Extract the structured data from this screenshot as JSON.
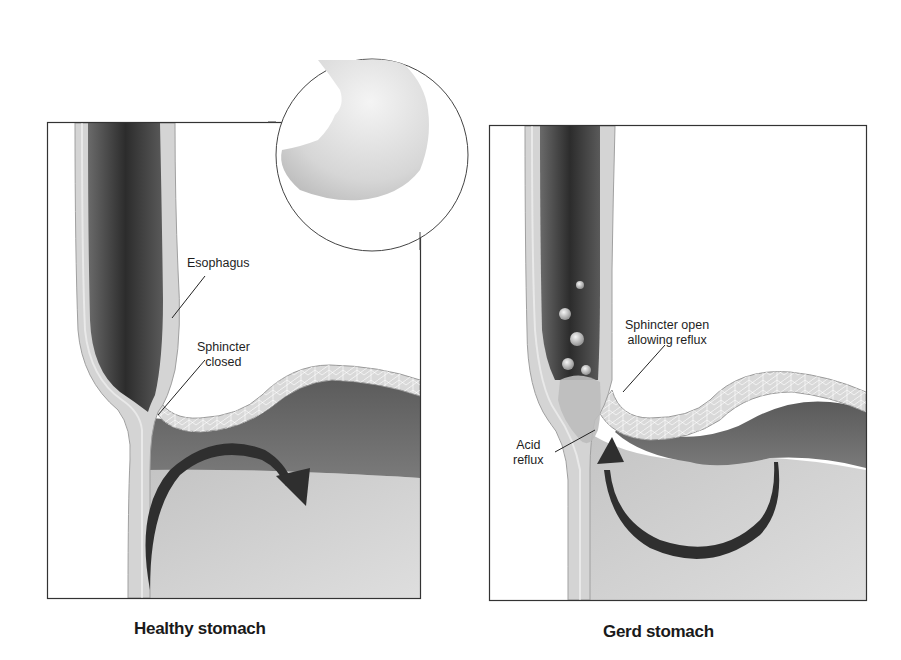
{
  "colors": {
    "frame": "#333333",
    "lumen_dark": "#3a3a3a",
    "wall": "#d8d8d8",
    "stomach_upper": "#6e6e6e",
    "stomach_lower": "#c9c9c9",
    "arrow": "#2f2f2f"
  },
  "panels": [
    {
      "caption": "Healthy stomach",
      "labels": [
        {
          "text": "Esophagus"
        },
        {
          "text": "Sphincter\nclosed"
        }
      ],
      "arrow_direction": "clockwise-into-stomach"
    },
    {
      "caption": "Gerd stomach",
      "labels": [
        {
          "text": "Sphincter open\nallowing reflux"
        },
        {
          "text": "Acid\nreflux"
        }
      ],
      "arrow_direction": "counterclockwise-up-esophagus",
      "bubbles": 6
    }
  ],
  "inset": {
    "subject": "stomach"
  }
}
